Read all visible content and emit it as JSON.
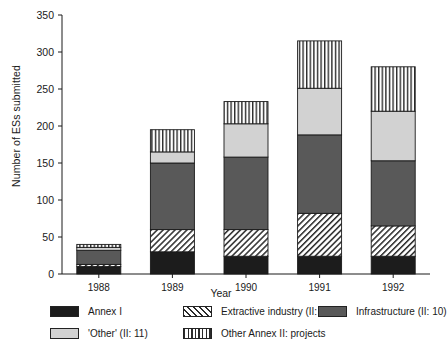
{
  "chart_data": {
    "type": "bar",
    "subtype": "stacked",
    "title": "",
    "xlabel": "Year",
    "ylabel": "Number of ESs submitted",
    "categories": [
      "1988",
      "1989",
      "1990",
      "1991",
      "1992"
    ],
    "ylim": [
      0,
      350
    ],
    "yticks": [
      0,
      50,
      100,
      150,
      200,
      250,
      300,
      350
    ],
    "ytick_labels": [
      "0",
      "50",
      "100",
      "150",
      "200",
      "250",
      "300",
      "350"
    ],
    "grid": false,
    "legend_position": "below",
    "series": [
      {
        "name": "Annex I",
        "pattern": "solid-black",
        "color": "#1c1c1c",
        "values": [
          10,
          30,
          24,
          24,
          24
        ]
      },
      {
        "name": "Extractive industry (II: 2)",
        "pattern": "diagonal-hatch",
        "color": "#ffffff",
        "values": [
          3,
          30,
          36,
          58,
          41
        ]
      },
      {
        "name": "Infrastructure (II: 10)",
        "pattern": "solid-dark-gray",
        "color": "#595959",
        "values": [
          19,
          90,
          98,
          106,
          88
        ]
      },
      {
        "name": "'Other' (II: 11)",
        "pattern": "solid-light-gray",
        "color": "#d2d2d2",
        "values": [
          4,
          15,
          45,
          63,
          67
        ]
      },
      {
        "name": "Other Annex II: projects",
        "pattern": "vertical-lines",
        "color": "#ffffff",
        "values": [
          4,
          30,
          30,
          64,
          60
        ]
      }
    ],
    "totals": [
      40,
      195,
      233,
      315,
      280
    ]
  },
  "legend": {
    "items": [
      {
        "label": "Annex I",
        "swatch": "sw-annex1",
        "col": 0,
        "row": 0
      },
      {
        "label": "Extractive industry (II: 2)",
        "swatch": "sw-extract",
        "col": 1,
        "row": 0
      },
      {
        "label": "Infrastructure (II: 10)",
        "swatch": "sw-infra",
        "col": 2,
        "row": 0
      },
      {
        "label": "'Other' (II: 11)",
        "swatch": "sw-other",
        "col": 0,
        "row": 1
      },
      {
        "label": "Other Annex II: projects",
        "swatch": "sw-annex2",
        "col": 1,
        "row": 1
      }
    ]
  }
}
